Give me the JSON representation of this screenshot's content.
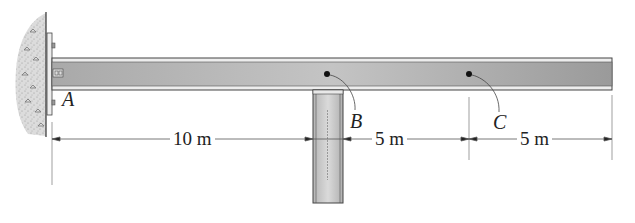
{
  "figure": {
    "type": "beam-diagram",
    "points": [
      {
        "id": "A",
        "label": "A"
      },
      {
        "id": "B",
        "label": "B"
      },
      {
        "id": "C",
        "label": "C"
      }
    ],
    "dimensions": [
      {
        "id": "AB",
        "label": "10 m"
      },
      {
        "id": "BC",
        "label": "5 m"
      },
      {
        "id": "C-end",
        "label": "5 m"
      }
    ],
    "colors": {
      "beam_fill": "#b8b8b8",
      "beam_edge": "#444444",
      "beam_flange": "#e6e6e6",
      "wall_fill": "#d6d6d6",
      "column_fill": "#c8c8c8",
      "line": "#555555"
    }
  }
}
